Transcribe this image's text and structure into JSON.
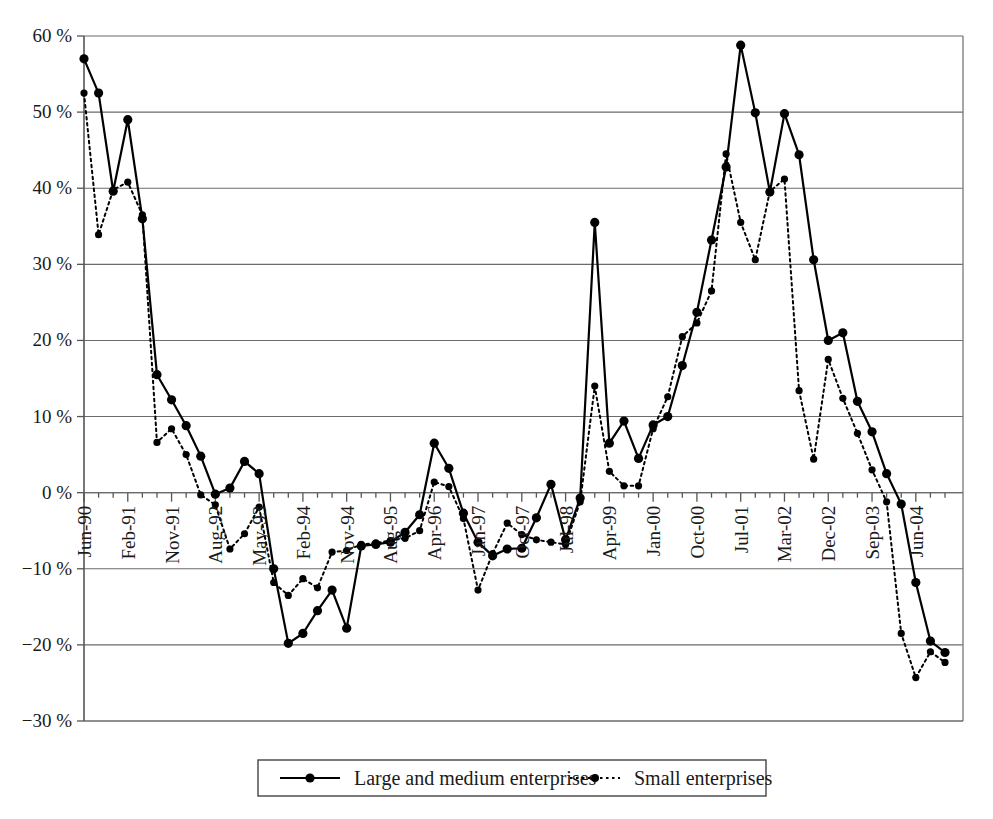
{
  "chart_data": {
    "type": "line",
    "title": "",
    "subtitle": "",
    "xlabel": "",
    "ylabel": "",
    "ylim": [
      -30,
      60
    ],
    "ytick_step": 10,
    "ytick_labels": [
      "60 %",
      "50 %",
      "40 %",
      "30 %",
      "20 %",
      "10 %",
      "0 %",
      "-10 %",
      "-20 %",
      "-30 %"
    ],
    "ytick_values": [
      60,
      50,
      40,
      30,
      20,
      10,
      0,
      -10,
      -20,
      -30
    ],
    "grid": true,
    "legend_position": "bottom",
    "x_tick_label_interval": 3,
    "x_tick_labels": [
      "Jun-90",
      "Feb-91",
      "Nov-91",
      "Aug-92",
      "May-93",
      "Feb-94",
      "Nov-94",
      "Aug-95",
      "Apr-96",
      "Jan-97",
      "Oct-97",
      "Jul-98",
      "Apr-99",
      "Jan-00",
      "Oct-00",
      "Jul-01",
      "Mar-02",
      "Dec-02",
      "Sep-03",
      "Jun-04"
    ],
    "x": [
      "Jun-90",
      "Sep-90",
      "Dec-90",
      "Feb-91",
      "May-91",
      "Aug-91",
      "Nov-91",
      "Feb-92",
      "May-92",
      "Aug-92",
      "Nov-92",
      "Feb-93",
      "May-93",
      "Aug-93",
      "Nov-93",
      "Feb-94",
      "May-94",
      "Aug-94",
      "Nov-94",
      "Feb-95",
      "May-95",
      "Aug-95",
      "Nov-95",
      "Jan-96",
      "Apr-96",
      "Jul-96",
      "Oct-96",
      "Jan-97",
      "Apr-97",
      "Jul-97",
      "Oct-97",
      "Jan-98",
      "Apr-98",
      "Jul-98",
      "Oct-98",
      "Jan-99",
      "Apr-99",
      "Jul-99",
      "Oct-99",
      "Jan-00",
      "Apr-00",
      "Jul-00",
      "Oct-00",
      "Jan-01",
      "Apr-01",
      "Jul-01",
      "Oct-01",
      "Dec-01",
      "Mar-02",
      "Jun-02",
      "Sep-02",
      "Dec-02",
      "Mar-03",
      "Jun-03",
      "Sep-03",
      "Dec-03",
      "Mar-04",
      "Jun-04",
      "Sep-04",
      "Dec-04"
    ],
    "series": [
      {
        "name": "Large and medium enterprises",
        "style": "solid",
        "marker": "circle",
        "values": [
          57.0,
          52.5,
          39.6,
          49.0,
          36.0,
          15.5,
          12.2,
          8.8,
          4.8,
          -0.2,
          0.6,
          4.1,
          2.5,
          -10.0,
          -19.8,
          -18.5,
          -15.5,
          -12.8,
          -17.8,
          -7.0,
          -6.8,
          -6.5,
          -5.2,
          -2.9,
          6.5,
          3.2,
          -2.7,
          -6.5,
          -8.3,
          -7.4,
          -7.3,
          -3.3,
          1.1,
          -6.2,
          -0.7,
          35.5,
          6.5,
          9.4,
          4.5,
          8.9,
          10.0,
          16.7,
          23.7,
          33.2,
          42.8,
          58.8,
          49.9,
          39.5,
          49.8,
          44.4,
          30.6,
          20.0,
          21.0,
          12.0,
          8.0,
          2.5,
          -1.5,
          -11.8,
          -19.5,
          -21.0
        ]
      },
      {
        "name": "Small enterprises",
        "style": "dotted",
        "marker": "circle-small",
        "values": [
          52.5,
          33.9,
          39.8,
          40.8,
          36.5,
          6.6,
          8.4,
          5.0,
          -0.3,
          -1.6,
          -7.4,
          -5.4,
          -1.9,
          -11.8,
          -13.5,
          -11.3,
          -12.5,
          -7.8,
          -7.6,
          -6.8,
          -6.6,
          -6.3,
          -6.0,
          -5.0,
          1.4,
          0.8,
          -3.4,
          -12.8,
          -8.0,
          -4.0,
          -5.5,
          -6.2,
          -6.5,
          -6.8,
          -1.2,
          14.0,
          2.8,
          0.9,
          0.9,
          8.4,
          12.6,
          20.5,
          22.3,
          26.5,
          44.5,
          35.5,
          30.6,
          39.6,
          41.2,
          13.4,
          4.4,
          17.5,
          12.4,
          7.8,
          3.0,
          -1.2,
          -18.5,
          -24.3,
          -20.9,
          -22.3
        ]
      }
    ]
  },
  "legend": {
    "items": [
      {
        "label": "Large and medium enterprises",
        "style": "solid"
      },
      {
        "label": "Small enterprises",
        "style": "dotted"
      }
    ]
  }
}
